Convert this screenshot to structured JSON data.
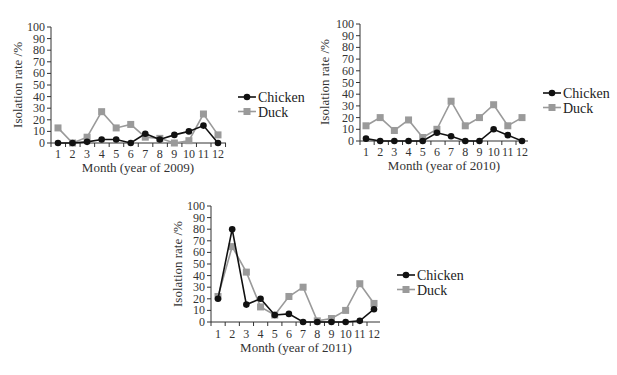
{
  "chart_data": [
    {
      "type": "line",
      "title": "",
      "xlabel": "Month (year of 2009)",
      "ylabel": "Isolation rate /%",
      "categories": [
        "1",
        "2",
        "3",
        "4",
        "5",
        "6",
        "7",
        "8",
        "9",
        "10",
        "11",
        "12"
      ],
      "ylim": [
        0,
        100
      ],
      "yticks": [
        0,
        10,
        20,
        30,
        40,
        50,
        60,
        70,
        80,
        90,
        100
      ],
      "grid": false,
      "legend": "right",
      "series": [
        {
          "name": "Chicken",
          "marker": "circle",
          "color": "#111111",
          "values": [
            0,
            0,
            1,
            3,
            3,
            0,
            8,
            3,
            7,
            10,
            15,
            0
          ]
        },
        {
          "name": "Duck",
          "marker": "square",
          "color": "#9a9a9a",
          "values": [
            13,
            0,
            5,
            27,
            13,
            16,
            5,
            4,
            0,
            2,
            25,
            7
          ]
        }
      ]
    },
    {
      "type": "line",
      "title": "",
      "xlabel": "Month (year of 2010)",
      "ylabel": "Isolation rate /%",
      "categories": [
        "1",
        "2",
        "3",
        "4",
        "5",
        "6",
        "7",
        "8",
        "9",
        "10",
        "11",
        "12"
      ],
      "ylim": [
        0,
        100
      ],
      "yticks": [
        0,
        10,
        20,
        30,
        40,
        50,
        60,
        70,
        80,
        90,
        100
      ],
      "grid": false,
      "legend": "right",
      "series": [
        {
          "name": "Chicken",
          "marker": "circle",
          "color": "#111111",
          "values": [
            2,
            0,
            0,
            0,
            0,
            7,
            4,
            0,
            0,
            10,
            5,
            0
          ]
        },
        {
          "name": "Duck",
          "marker": "square",
          "color": "#9a9a9a",
          "values": [
            13,
            20,
            9,
            18,
            3,
            10,
            34,
            13,
            20,
            31,
            13,
            20
          ]
        }
      ]
    },
    {
      "type": "line",
      "title": "",
      "xlabel": "Month (year of 2011)",
      "ylabel": "Isolation rate /%",
      "categories": [
        "1",
        "2",
        "3",
        "4",
        "5",
        "6",
        "7",
        "8",
        "9",
        "10",
        "11",
        "12"
      ],
      "ylim": [
        0,
        100
      ],
      "yticks": [
        0,
        10,
        20,
        30,
        40,
        50,
        60,
        70,
        80,
        90,
        100
      ],
      "grid": false,
      "legend": "right",
      "series": [
        {
          "name": "Chicken",
          "marker": "circle",
          "color": "#111111",
          "values": [
            20,
            80,
            15,
            20,
            6,
            7,
            0,
            0,
            0,
            0,
            1,
            11
          ]
        },
        {
          "name": "Duck",
          "marker": "square",
          "color": "#9a9a9a",
          "values": [
            22,
            65,
            43,
            13,
            6,
            22,
            30,
            1,
            3,
            10,
            33,
            16
          ]
        }
      ]
    }
  ]
}
